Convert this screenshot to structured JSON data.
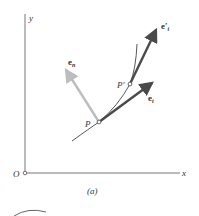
{
  "figure": {
    "caption": "(a)",
    "axes": {
      "x_label": "x",
      "y_label": "y",
      "origin_label": "O"
    },
    "points": [
      {
        "id": "P",
        "label": "P"
      },
      {
        "id": "P_prime",
        "label": "P′"
      }
    ],
    "vectors": [
      {
        "id": "e_t",
        "label": "e",
        "subscript": "t",
        "color": "#4a4a4a"
      },
      {
        "id": "e_t_prime",
        "label": "e′",
        "subscript": "t",
        "color": "#4a4a4a"
      },
      {
        "id": "e_n",
        "label": "e",
        "subscript": "n",
        "color": "#bdbdbd"
      }
    ],
    "colors": {
      "axis": "#777777",
      "curve": "#444444",
      "dark_vector": "#4a4a4a",
      "light_vector": "#bdbdbd"
    }
  }
}
